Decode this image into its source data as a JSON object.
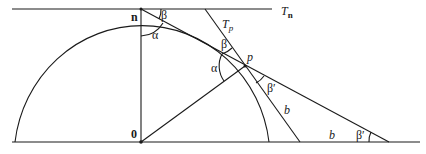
{
  "diagram": {
    "points": {
      "n": {
        "label": "n",
        "x": 141,
        "y": 9
      },
      "o": {
        "label": "0",
        "x": 141,
        "y": 142
      },
      "p": {
        "label": "p",
        "x": 245,
        "y": 66
      }
    },
    "lines": {
      "tangent_n_label": "T",
      "tangent_n_sub": "n",
      "tangent_p_label": "T",
      "tangent_p_sub": "p"
    },
    "angles": {
      "alpha_at_n": "α",
      "beta_at_n": "β",
      "alpha_at_p": "α",
      "beta_at_p": "β",
      "beta_prime_at_p": "β′",
      "beta_prime_at_base": "β′"
    },
    "segments": {
      "b_slant": "b",
      "b_base": "b"
    },
    "colors": {
      "stroke": "#1a1a1a",
      "background": "#ffffff"
    }
  }
}
